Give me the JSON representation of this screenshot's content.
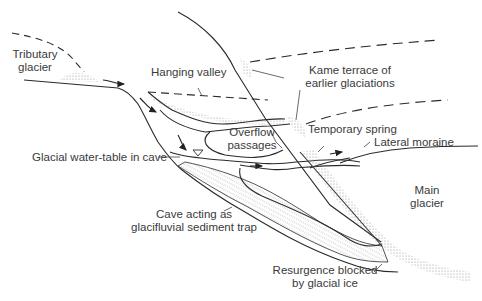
{
  "diagram": {
    "title": "",
    "labels": {
      "tributary_glacier": [
        "Tributary",
        "glacier"
      ],
      "hanging_valley": "Hanging valley",
      "kame_terrace": [
        "Kame terrace of",
        "earlier glaciations"
      ],
      "overflow_passages": [
        "Overflow",
        "passages"
      ],
      "temporary_spring": "Temporary spring",
      "lateral_moraine": "Lateral moraine",
      "glacial_water_table": "Glacial water-table in cave",
      "main_glacier": [
        "Main",
        "glacier"
      ],
      "sediment_trap": [
        "Cave acting as",
        "glacifluvial sediment trap"
      ],
      "resurgence": [
        "Resurgence blocked",
        "by glacial ice"
      ]
    },
    "colors": {
      "line": "#2a2a2a",
      "text": "#3a3a3a",
      "stipple": "#9a9a9a"
    }
  }
}
